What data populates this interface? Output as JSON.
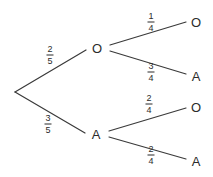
{
  "diagram": {
    "type": "probability-tree",
    "background_color": "#ffffff",
    "line_color": "#3a3a3a",
    "text_color": "#2b2b2b",
    "width": 213,
    "height": 177,
    "root": {
      "label": "",
      "x": 15,
      "y": 92
    },
    "level1": [
      {
        "name": "branch-o",
        "label": "O",
        "x": 97,
        "y": 48,
        "probability": {
          "numerator": "2",
          "denominator": "5",
          "label_x": 50,
          "label_y": 55
        }
      },
      {
        "name": "branch-a",
        "label": "A",
        "x": 96,
        "y": 134,
        "probability": {
          "numerator": "3",
          "denominator": "5",
          "label_x": 48,
          "label_y": 124
        }
      }
    ],
    "level2": [
      {
        "name": "leaf-o-o",
        "parent": "branch-o",
        "label": "O",
        "x": 196,
        "y": 22,
        "probability": {
          "numerator": "1",
          "denominator": "4",
          "label_x": 151,
          "label_y": 22
        }
      },
      {
        "name": "leaf-o-a",
        "parent": "branch-o",
        "label": "A",
        "x": 196,
        "y": 76,
        "probability": {
          "numerator": "3",
          "denominator": "4",
          "label_x": 151,
          "label_y": 72
        }
      },
      {
        "name": "leaf-a-o",
        "parent": "branch-a",
        "label": "O",
        "x": 196,
        "y": 107,
        "probability": {
          "numerator": "2",
          "denominator": "4",
          "label_x": 149,
          "label_y": 104
        }
      },
      {
        "name": "leaf-a-a",
        "parent": "branch-a",
        "label": "A",
        "x": 196,
        "y": 161,
        "probability": {
          "numerator": "2",
          "denominator": "4",
          "label_x": 151,
          "label_y": 155
        }
      }
    ]
  }
}
